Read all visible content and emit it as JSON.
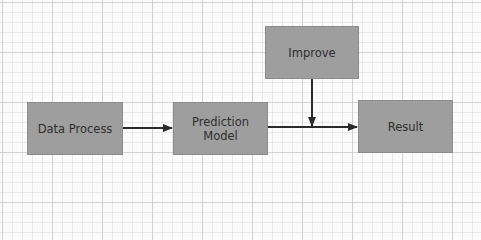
{
  "diagram": {
    "nodes": [
      {
        "id": "data_process",
        "label": "Data Process"
      },
      {
        "id": "prediction_model",
        "label_line1": "Prediction",
        "label_line2": "Model"
      },
      {
        "id": "improve",
        "label": "Improve"
      },
      {
        "id": "result",
        "label": "Result"
      }
    ],
    "edges": [
      {
        "from": "Data Process",
        "to": "Prediction Model"
      },
      {
        "from": "Prediction Model",
        "to": "Result"
      },
      {
        "from": "Improve",
        "to": "Prediction Model → Result edge"
      }
    ],
    "colors": {
      "node_fill": "#9e9e9e",
      "node_text": "#2f2f2f",
      "edge": "#2a2a2a",
      "background": "#fbfbfb",
      "grid": "#d0d0d0"
    }
  }
}
